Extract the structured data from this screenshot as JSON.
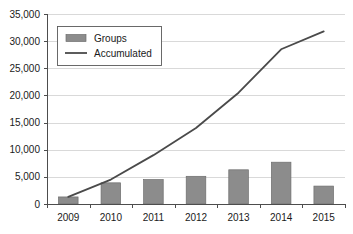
{
  "chart_data": {
    "type": "bar",
    "title": "",
    "xlabel": "",
    "ylabel": "",
    "categories": [
      "2009",
      "2010",
      "2011",
      "2012",
      "2013",
      "2014",
      "2015"
    ],
    "ylim": [
      0,
      35000
    ],
    "ytick_values": [
      0,
      5000,
      10000,
      15000,
      20000,
      25000,
      30000,
      35000
    ],
    "ytick_labels": [
      "0",
      "5,000",
      "10,000",
      "15,000",
      "20,000",
      "25,000",
      "30,000",
      "35,000"
    ],
    "grid": true,
    "legend_position": "upper-left",
    "series": [
      {
        "name": "Groups",
        "type": "bar",
        "color": "#8c8c8c",
        "values": [
          1300,
          3900,
          4500,
          5100,
          6300,
          7700,
          3300
        ]
      },
      {
        "name": "Accumulated",
        "type": "line",
        "color": "#4a4a4a",
        "values": [
          1300,
          4500,
          9000,
          14000,
          20500,
          28500,
          31800
        ]
      }
    ]
  },
  "legend": {
    "entries": [
      {
        "label": "Groups",
        "marker": "swatch"
      },
      {
        "label": "Accumulated",
        "marker": "line"
      }
    ]
  },
  "axes": {
    "y_axis_name": "value-axis",
    "x_axis_name": "year-axis"
  }
}
